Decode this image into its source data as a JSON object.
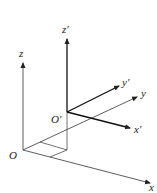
{
  "diagram": {
    "frames": [
      {
        "name": "fixed-frame",
        "origin_label": "O",
        "axes": [
          {
            "label": "x"
          },
          {
            "label": "y"
          },
          {
            "label": "z"
          }
        ]
      },
      {
        "name": "moving-frame",
        "origin_label": "O′",
        "axes": [
          {
            "label": "x′"
          },
          {
            "label": "y′"
          },
          {
            "label": "z′"
          }
        ]
      }
    ],
    "colors": {
      "line": "#333333",
      "primed_line": "#111111"
    }
  }
}
